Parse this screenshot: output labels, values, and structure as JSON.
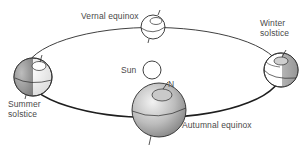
{
  "diagram": {
    "type": "earth-orbit-seasons",
    "orbit": {
      "cx": 153,
      "cy": 73,
      "rx": 128,
      "ry": 45,
      "stroke": "#2a2a2a"
    },
    "sun": {
      "label": "Sun",
      "cx": 152,
      "cy": 70,
      "r": 9
    },
    "north_marker": {
      "label": "N"
    },
    "positions": [
      {
        "id": "vernal-equinox",
        "label": "Vernal equinox",
        "cx": 153,
        "cy": 27,
        "r": 12
      },
      {
        "id": "winter-solstice",
        "label_line1": "Winter",
        "label_line2": "solstice",
        "cx": 281,
        "cy": 70,
        "r": 17
      },
      {
        "id": "summer-solstice",
        "label_line1": "Summer",
        "label_line2": "solstice",
        "cx": 33,
        "cy": 77,
        "r": 19
      },
      {
        "id": "autumnal-equinox",
        "label": "Autumnal equinox",
        "cx": 159,
        "cy": 110,
        "r": 27
      }
    ],
    "colors": {
      "line": "#2a2a2a",
      "text": "#4a4a4a",
      "globe_light": "#f4f4f4",
      "globe_mid": "#bdbdbd",
      "globe_dark": "#8a8a8a"
    }
  }
}
